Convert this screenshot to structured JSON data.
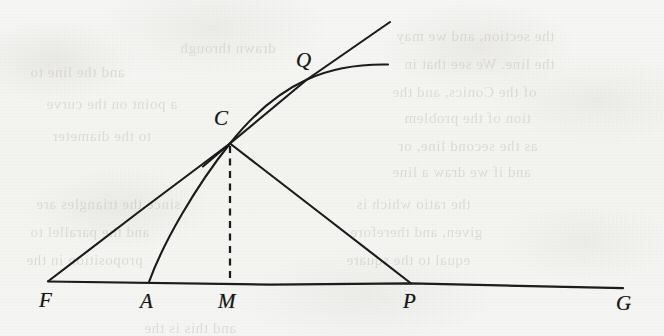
{
  "figure": {
    "kind": "geometry-diagram",
    "background_color": "#f5f5f3",
    "ink_color": "#1a1a1a",
    "labels": [
      {
        "id": "label-Q",
        "text": "Q",
        "x": 296,
        "y": 50,
        "point_x": 307,
        "point_y": 80
      },
      {
        "id": "label-C",
        "text": "C",
        "x": 214,
        "y": 108,
        "point_x": 230,
        "point_y": 143
      },
      {
        "id": "label-F",
        "text": "F",
        "x": 39,
        "y": 290,
        "point_x": 48,
        "point_y": 281
      },
      {
        "id": "label-A",
        "text": "A",
        "x": 140,
        "y": 291,
        "point_x": 149,
        "point_y": 282
      },
      {
        "id": "label-M",
        "text": "M",
        "x": 218,
        "y": 291,
        "point_x": 230,
        "point_y": 283
      },
      {
        "id": "label-P",
        "text": "P",
        "x": 403,
        "y": 291,
        "point_x": 410,
        "point_y": 283
      },
      {
        "id": "label-G",
        "text": "G",
        "x": 616,
        "y": 293,
        "point_x": 623,
        "point_y": 288
      }
    ],
    "strokes": [
      {
        "id": "baseline-FG",
        "name": "baseline-line-fg",
        "type": "line",
        "from": [
          48,
          281
        ],
        "to": [
          623,
          288
        ]
      },
      {
        "id": "segment-FC",
        "name": "segment-line-fc",
        "type": "line",
        "from": [
          48,
          281
        ],
        "to": [
          230,
          143
        ]
      },
      {
        "id": "segment-CP",
        "name": "segment-line-cp",
        "type": "line",
        "from": [
          230,
          143
        ],
        "to": [
          410,
          283
        ]
      },
      {
        "id": "altitude-CM",
        "name": "altitude-dashed-cm",
        "type": "dashed",
        "from": [
          230,
          145
        ],
        "to": [
          230,
          283
        ]
      },
      {
        "id": "tangent-at-C",
        "name": "tangent-line-at-c",
        "type": "line",
        "from": [
          203,
          166
        ],
        "to": [
          390,
          22
        ]
      },
      {
        "id": "curve-A-C-Q",
        "name": "curve-through-a-c-q",
        "type": "curve",
        "from": [
          149,
          282
        ],
        "to": [
          388,
          64
        ]
      }
    ],
    "ghost_text_lines": [
      {
        "text": "the section, and we may",
        "x": 396,
        "y": 28
      },
      {
        "text": "the line. We see that in",
        "x": 404,
        "y": 56
      },
      {
        "text": "of the Conics, and the",
        "x": 392,
        "y": 84
      },
      {
        "text": "tion of the problem",
        "x": 404,
        "y": 110
      },
      {
        "text": "as the second line, or",
        "x": 398,
        "y": 138
      },
      {
        "text": "and if we draw a line",
        "x": 392,
        "y": 164
      },
      {
        "text": "since the triangles are",
        "x": 36,
        "y": 196
      },
      {
        "text": "and the parallel to",
        "x": 30,
        "y": 224
      },
      {
        "text": "proposition in the",
        "x": 26,
        "y": 252
      },
      {
        "text": "the ratio which is",
        "x": 356,
        "y": 196
      },
      {
        "text": "given, and therefore",
        "x": 350,
        "y": 224
      },
      {
        "text": "equal to the square",
        "x": 346,
        "y": 252
      },
      {
        "text": "and this is the",
        "x": 144,
        "y": 320
      },
      {
        "text": "and the line to",
        "x": 30,
        "y": 64
      },
      {
        "text": "a point on the curve",
        "x": 46,
        "y": 96
      },
      {
        "text": "to the diameter",
        "x": 52,
        "y": 128
      },
      {
        "text": "drawn through",
        "x": 180,
        "y": 40
      }
    ]
  }
}
